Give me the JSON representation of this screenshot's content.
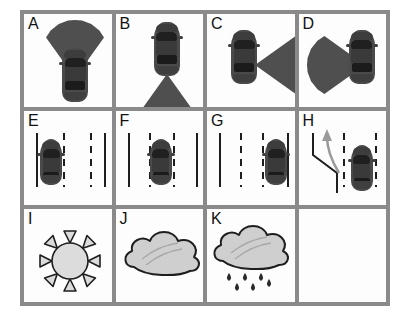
{
  "figure": {
    "kind": "icon-legend-grid",
    "columns": 4,
    "rows": 3,
    "border_color": "#8a8a8a",
    "cell_background": "#fdfdfd",
    "ink_color": "#1e1e1e",
    "car_color": "#4a4a4a",
    "cone_color": "#4f4f4f",
    "cells": [
      {
        "id": "A",
        "label": "A",
        "icon": "car-sensor-cone-front-icon",
        "description": "Top-down car with sensor detection cone pointing forward",
        "car_heading": "up",
        "cone_direction": "front"
      },
      {
        "id": "B",
        "label": "B",
        "icon": "car-sensor-cone-rear-icon",
        "description": "Top-down car with sensor detection cone pointing rearward",
        "car_heading": "up",
        "cone_direction": "rear"
      },
      {
        "id": "C",
        "label": "C",
        "icon": "car-sensor-cone-right-icon",
        "description": "Top-down car with sensor detection cone pointing to the right side",
        "car_heading": "up",
        "cone_direction": "right"
      },
      {
        "id": "D",
        "label": "D",
        "icon": "car-sensor-cone-left-icon",
        "description": "Top-down car with sensor detection cone pointing to the left side",
        "car_heading": "up",
        "cone_direction": "left"
      },
      {
        "id": "E",
        "label": "E",
        "icon": "car-in-left-lane-icon",
        "description": "Three-lane road, car positioned in the left lane",
        "lane_occupied": "left",
        "lane_count": 3
      },
      {
        "id": "F",
        "label": "F",
        "icon": "car-in-center-lane-icon",
        "description": "Three-lane road, car positioned in the center lane",
        "lane_occupied": "center",
        "lane_count": 3
      },
      {
        "id": "G",
        "label": "G",
        "icon": "car-in-right-lane-icon",
        "description": "Three-lane road, car positioned in the right lane",
        "lane_occupied": "right",
        "lane_count": 3
      },
      {
        "id": "H",
        "label": "H",
        "icon": "car-merge-from-ramp-icon",
        "description": "Car on roadway with on-ramp merge arrow joining from the left",
        "arrow_color": "#9a9a9a",
        "lane_count": 2
      },
      {
        "id": "I",
        "label": "I",
        "icon": "sun-icon",
        "description": "Sun symbol indicating clear weather",
        "ray_count": 8,
        "fill_color": "#d9d9d9"
      },
      {
        "id": "J",
        "label": "J",
        "icon": "cloud-icon",
        "description": "Cloud symbol indicating cloudy weather",
        "fill_color": "#cccccc"
      },
      {
        "id": "K",
        "label": "K",
        "icon": "rain-cloud-icon",
        "description": "Cloud with raindrops indicating rainy weather",
        "fill_color": "#cccccc",
        "raindrop_count": 6
      },
      {
        "id": "blank",
        "label": "",
        "icon": "empty-cell",
        "description": "Empty unlabeled cell"
      }
    ]
  }
}
